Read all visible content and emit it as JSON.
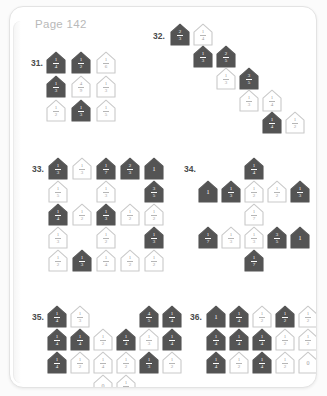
{
  "page": {
    "label": "Page 142",
    "label_color": "#b9b9b9",
    "background": "#ffffff",
    "card_background": "#ffffff",
    "card_border": "#e3e3e3"
  },
  "style": {
    "filled_fill": "#545454",
    "filled_text": "#ffffff",
    "open_stroke": "#c9c9c9",
    "open_text": "#9e9e9e",
    "number_color": "#4a4a4a"
  },
  "problems": [
    {
      "number": "31.",
      "num_x": 21,
      "num_y": 51,
      "grid_x": 36,
      "grid_y": 44,
      "col_w": 25,
      "row_h": 24,
      "houses": [
        {
          "r": 0,
          "c": 0,
          "state": "filled",
          "num": "1",
          "den": "4"
        },
        {
          "r": 0,
          "c": 1,
          "state": "filled",
          "num": "1",
          "den": "2"
        },
        {
          "r": 0,
          "c": 2,
          "state": "open",
          "num": "1",
          "den": "6"
        },
        {
          "r": 1,
          "c": 0,
          "state": "filled",
          "num": "1",
          "den": "3"
        },
        {
          "r": 1,
          "c": 1,
          "state": "open",
          "num": "4",
          "den": "9"
        },
        {
          "r": 1,
          "c": 2,
          "state": "open",
          "num": "1",
          "den": "3"
        },
        {
          "r": 2,
          "c": 0,
          "state": "open",
          "num": "1",
          "den": "2"
        },
        {
          "r": 2,
          "c": 1,
          "state": "filled",
          "num": "1",
          "den": "3"
        },
        {
          "r": 2,
          "c": 2,
          "state": "open",
          "num": "1",
          "den": "5"
        }
      ]
    },
    {
      "number": "32.",
      "num_x": 143,
      "num_y": 24,
      "grid_x": 160,
      "grid_y": 16,
      "col_w": 23,
      "row_h": 22,
      "houses": [
        {
          "r": 0,
          "c": 0,
          "state": "filled",
          "num": "2",
          "den": "3"
        },
        {
          "r": 0,
          "c": 1,
          "state": "open",
          "num": "1",
          "den": "4"
        },
        {
          "r": 1,
          "c": 1,
          "state": "filled",
          "num": "1",
          "den": "3"
        },
        {
          "r": 1,
          "c": 2,
          "state": "filled",
          "num": "2",
          "den": "5"
        },
        {
          "r": 2,
          "c": 2,
          "state": "open",
          "num": "1",
          "den": "3"
        },
        {
          "r": 2,
          "c": 3,
          "state": "filled",
          "num": "3",
          "den": "5"
        },
        {
          "r": 3,
          "c": 3,
          "state": "open",
          "num": "1",
          "den": "3"
        },
        {
          "r": 3,
          "c": 4,
          "state": "open",
          "num": "1",
          "den": "4"
        },
        {
          "r": 4,
          "c": 4,
          "state": "filled",
          "num": "1",
          "den": "4"
        },
        {
          "r": 4,
          "c": 5,
          "state": "open",
          "num": "1",
          "den": "2"
        }
      ]
    },
    {
      "number": "33.",
      "num_x": 22,
      "num_y": 157,
      "grid_x": 38,
      "grid_y": 150,
      "col_w": 24,
      "row_h": 23,
      "houses": [
        {
          "r": 0,
          "c": 0,
          "state": "filled",
          "num": "1",
          "den": "3"
        },
        {
          "r": 0,
          "c": 1,
          "state": "open",
          "num": "1",
          "den": "3"
        },
        {
          "r": 0,
          "c": 2,
          "state": "filled",
          "num": "1",
          "den": "7"
        },
        {
          "r": 0,
          "c": 3,
          "state": "filled",
          "num": "2",
          "den": "3"
        },
        {
          "r": 0,
          "c": 4,
          "state": "filled",
          "num": "1",
          "den": ""
        },
        {
          "r": 1,
          "c": 0,
          "state": "open",
          "num": "1",
          "den": "5"
        },
        {
          "r": 1,
          "c": 2,
          "state": "open",
          "num": "1",
          "den": "3"
        },
        {
          "r": 1,
          "c": 4,
          "state": "filled",
          "num": "3",
          "den": "5"
        },
        {
          "r": 2,
          "c": 0,
          "state": "filled",
          "num": "1",
          "den": "4"
        },
        {
          "r": 2,
          "c": 1,
          "state": "open",
          "num": "1",
          "den": "2"
        },
        {
          "r": 2,
          "c": 2,
          "state": "filled",
          "num": "1",
          "den": "3"
        },
        {
          "r": 2,
          "c": 3,
          "state": "open",
          "num": "1",
          "den": "2"
        },
        {
          "r": 2,
          "c": 4,
          "state": "open",
          "num": "1",
          "den": "2"
        },
        {
          "r": 3,
          "c": 0,
          "state": "open",
          "num": "1",
          "den": "3"
        },
        {
          "r": 3,
          "c": 2,
          "state": "open",
          "num": "1",
          "den": "2"
        },
        {
          "r": 3,
          "c": 4,
          "state": "filled",
          "num": "1",
          "den": "3"
        },
        {
          "r": 4,
          "c": 0,
          "state": "open",
          "num": "1",
          "den": "2"
        },
        {
          "r": 4,
          "c": 1,
          "state": "filled",
          "num": "1",
          "den": "3"
        },
        {
          "r": 4,
          "c": 2,
          "state": "open",
          "num": "1",
          "den": "4"
        },
        {
          "r": 4,
          "c": 3,
          "state": "open",
          "num": "1",
          "den": "2"
        },
        {
          "r": 4,
          "c": 4,
          "state": "open",
          "num": "1",
          "den": "2"
        }
      ]
    },
    {
      "number": "34.",
      "num_x": 174,
      "num_y": 157,
      "grid_x": 188,
      "grid_y": 150,
      "col_w": 23,
      "row_h": 23,
      "houses": [
        {
          "r": 0,
          "c": 2,
          "state": "filled",
          "num": "1",
          "den": "4"
        },
        {
          "r": 1,
          "c": 0,
          "state": "filled",
          "num": "1",
          "den": ""
        },
        {
          "r": 1,
          "c": 1,
          "state": "filled",
          "num": "1",
          "den": "3"
        },
        {
          "r": 1,
          "c": 2,
          "state": "open",
          "num": "1",
          "den": "2"
        },
        {
          "r": 1,
          "c": 3,
          "state": "open",
          "num": "1",
          "den": "2"
        },
        {
          "r": 1,
          "c": 4,
          "state": "filled",
          "num": "1",
          "den": "3"
        },
        {
          "r": 2,
          "c": 2,
          "state": "open",
          "num": "1",
          "den": "7"
        },
        {
          "r": 3,
          "c": 0,
          "state": "filled",
          "num": "1",
          "den": "7"
        },
        {
          "r": 3,
          "c": 1,
          "state": "open",
          "num": "1",
          "den": "3"
        },
        {
          "r": 3,
          "c": 2,
          "state": "open",
          "num": "1",
          "den": "3"
        },
        {
          "r": 3,
          "c": 3,
          "state": "filled",
          "num": "3",
          "den": "5"
        },
        {
          "r": 3,
          "c": 4,
          "state": "filled",
          "num": "1",
          "den": ""
        },
        {
          "r": 4,
          "c": 2,
          "state": "filled",
          "num": "1",
          "den": "7"
        }
      ]
    },
    {
      "number": "35.",
      "num_x": 22,
      "num_y": 305,
      "grid_x": 37,
      "grid_y": 298,
      "col_w": 23,
      "row_h": 23,
      "houses": [
        {
          "r": 0,
          "c": 0,
          "state": "filled",
          "num": "1",
          "den": "4"
        },
        {
          "r": 0,
          "c": 1,
          "state": "open",
          "num": "1",
          "den": "3"
        },
        {
          "r": 0,
          "c": 4,
          "state": "filled",
          "num": "4",
          "den": "5"
        },
        {
          "r": 0,
          "c": 5,
          "state": "filled",
          "num": "1",
          "den": "4"
        },
        {
          "r": 1,
          "c": 0,
          "state": "filled",
          "num": "1",
          "den": "4"
        },
        {
          "r": 1,
          "c": 1,
          "state": "filled",
          "num": "1",
          "den": "4"
        },
        {
          "r": 1,
          "c": 2,
          "state": "open",
          "num": "1",
          "den": "2"
        },
        {
          "r": 1,
          "c": 3,
          "state": "filled",
          "num": "1",
          "den": "4"
        },
        {
          "r": 1,
          "c": 4,
          "state": "open",
          "num": "1",
          "den": "3"
        },
        {
          "r": 1,
          "c": 5,
          "state": "filled",
          "num": "1",
          "den": "4"
        },
        {
          "r": 2,
          "c": 0,
          "state": "filled",
          "num": "1",
          "den": "4"
        },
        {
          "r": 2,
          "c": 1,
          "state": "open",
          "num": "1",
          "den": "2"
        },
        {
          "r": 2,
          "c": 2,
          "state": "open",
          "num": "1",
          "den": "4"
        },
        {
          "r": 2,
          "c": 3,
          "state": "open",
          "num": "1",
          "den": "2"
        },
        {
          "r": 2,
          "c": 4,
          "state": "filled",
          "num": "1",
          "den": "3"
        },
        {
          "r": 2,
          "c": 5,
          "state": "open",
          "num": "1",
          "den": "2"
        },
        {
          "r": 3,
          "c": 2,
          "state": "open",
          "num": "0",
          "den": ""
        },
        {
          "r": 3,
          "c": 3,
          "state": "open",
          "num": "1",
          "den": "2"
        }
      ]
    },
    {
      "number": "36.",
      "num_x": 180,
      "num_y": 305,
      "grid_x": 196,
      "grid_y": 298,
      "col_w": 23,
      "row_h": 23,
      "houses": [
        {
          "r": 0,
          "c": 0,
          "state": "filled",
          "num": "1",
          "den": ""
        },
        {
          "r": 0,
          "c": 1,
          "state": "filled",
          "num": "1",
          "den": "4"
        },
        {
          "r": 0,
          "c": 2,
          "state": "open",
          "num": "1",
          "den": "2"
        },
        {
          "r": 0,
          "c": 3,
          "state": "filled",
          "num": "1",
          "den": "2"
        },
        {
          "r": 0,
          "c": 4,
          "state": "open",
          "num": "1",
          "den": "2"
        },
        {
          "r": 1,
          "c": 0,
          "state": "filled",
          "num": "1",
          "den": "4"
        },
        {
          "r": 1,
          "c": 1,
          "state": "filled",
          "num": "1",
          "den": "4"
        },
        {
          "r": 1,
          "c": 2,
          "state": "filled",
          "num": "1",
          "den": "4"
        },
        {
          "r": 1,
          "c": 3,
          "state": "open",
          "num": "1",
          "den": "2"
        },
        {
          "r": 1,
          "c": 4,
          "state": "open",
          "num": "1",
          "den": "2"
        },
        {
          "r": 2,
          "c": 0,
          "state": "filled",
          "num": "1",
          "den": "4"
        },
        {
          "r": 2,
          "c": 1,
          "state": "open",
          "num": "1",
          "den": "2"
        },
        {
          "r": 2,
          "c": 2,
          "state": "filled",
          "num": "1",
          "den": "4"
        },
        {
          "r": 2,
          "c": 3,
          "state": "open",
          "num": "1",
          "den": "2"
        },
        {
          "r": 2,
          "c": 4,
          "state": "open",
          "num": "0",
          "den": ""
        }
      ]
    }
  ]
}
